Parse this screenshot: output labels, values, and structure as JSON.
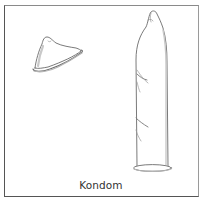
{
  "figure": {
    "caption": "Kondom",
    "frame_color": "#555555",
    "stroke_color": "#6b6b6b",
    "shade_color": "#c9c9c9",
    "items": [
      {
        "name": "unrolled-condom",
        "description": "Condom partly unrolled, small, tilted"
      },
      {
        "name": "fully-unrolled-condom",
        "description": "Fully unrolled condom, tall, upright"
      }
    ]
  }
}
